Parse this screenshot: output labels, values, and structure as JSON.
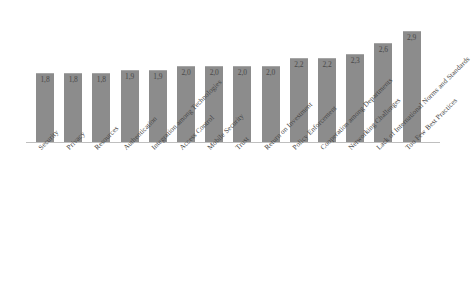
{
  "chart_data": {
    "type": "bar",
    "title": "",
    "subtitle": "",
    "xlabel": "",
    "ylabel": "",
    "ylim": [
      0,
      3.2
    ],
    "grid": false,
    "legend": "none",
    "orientation": "vertical",
    "decimal_separator": ",",
    "bar_color": "#8c8c8c",
    "axis_color": "#bfbfbf",
    "categories": [
      "Security",
      "Privacy",
      "Resources",
      "Authentication",
      "Integration among Technologies",
      "Access Control",
      "Mobile Security",
      "Trust",
      "Return on Investment",
      "Policy Enforcement",
      "Cooperation among Departments",
      "Networking Challenges",
      "Lack of International Norms and Standards",
      "Too Few Best Practices"
    ],
    "values": [
      1.8,
      1.8,
      1.8,
      1.9,
      1.9,
      2.0,
      2.0,
      2.0,
      2.0,
      2.2,
      2.2,
      2.3,
      2.6,
      2.9
    ],
    "value_labels": [
      "1,8",
      "1,8",
      "1,8",
      "1,9",
      "1,9",
      "2,0",
      "2,0",
      "2,0",
      "2,0",
      "2,2",
      "2,2",
      "2,3",
      "2,6",
      "2,9"
    ]
  }
}
